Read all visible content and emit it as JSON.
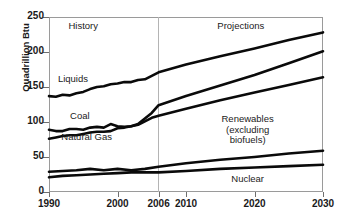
{
  "chart_data": {
    "type": "line",
    "title": "",
    "xlabel": "",
    "ylabel": "Quadrillion Btu",
    "xlim": [
      1990,
      2030
    ],
    "ylim": [
      0,
      250
    ],
    "xticks": [
      1990,
      2000,
      2006,
      2010,
      2020,
      2030
    ],
    "xtick_labels": [
      "1990",
      "2000",
      "2006",
      "2010",
      "2020",
      "2030"
    ],
    "yticks": [
      0,
      50,
      100,
      150,
      200,
      250
    ],
    "ytick_labels": [
      "0",
      "50",
      "100",
      "150",
      "200",
      "250"
    ],
    "grid": false,
    "legend": "inline-annotations",
    "divider_year": 2006,
    "annotations": [
      {
        "name": "history",
        "text": "History",
        "year": 1995,
        "value": 237
      },
      {
        "name": "projections",
        "text": "Projections",
        "year": 2018,
        "value": 237
      },
      {
        "name": "liquids",
        "text": "Liquids",
        "year": 1993.5,
        "value": 162
      },
      {
        "name": "coal",
        "text": "Coal",
        "year": 1994.5,
        "value": 109
      },
      {
        "name": "natural-gas",
        "text": "Natural Gas",
        "year": 1995.5,
        "value": 78
      },
      {
        "name": "renewables",
        "text": "Renewables (excluding biofuels)",
        "year": 2019,
        "value": 88
      },
      {
        "name": "nuclear",
        "text": "Nuclear",
        "year": 2019,
        "value": 18
      }
    ],
    "series": [
      {
        "name": "Liquids",
        "x": [
          1990,
          1991,
          1992,
          1993,
          1994,
          1995,
          1996,
          1997,
          1998,
          1999,
          2000,
          2001,
          2002,
          2003,
          2004,
          2005,
          2006,
          2010,
          2015,
          2020,
          2025,
          2030
        ],
        "values": [
          137,
          136,
          139,
          138,
          141,
          143,
          147,
          150,
          151,
          154,
          155,
          157,
          157,
          160,
          161,
          166,
          171,
          182,
          194,
          205,
          217,
          228
        ]
      },
      {
        "name": "Coal",
        "x": [
          1990,
          1991,
          1992,
          1993,
          1994,
          1995,
          1996,
          1997,
          1998,
          1999,
          2000,
          2001,
          2002,
          2003,
          2004,
          2005,
          2006,
          2010,
          2015,
          2020,
          2025,
          2030
        ],
        "values": [
          89,
          87,
          87,
          90,
          90,
          89,
          92,
          93,
          92,
          97,
          94,
          93,
          94,
          97,
          105,
          113,
          124,
          137,
          152,
          167,
          184,
          201
        ]
      },
      {
        "name": "Natural Gas",
        "x": [
          1990,
          1991,
          1992,
          1993,
          1994,
          1995,
          1996,
          1997,
          1998,
          1999,
          2000,
          2001,
          2002,
          2003,
          2004,
          2005,
          2006,
          2010,
          2015,
          2020,
          2025,
          2030
        ],
        "values": [
          76,
          78,
          80,
          81,
          81,
          83,
          85,
          86,
          86,
          87,
          91,
          92,
          94,
          96,
          101,
          106,
          109,
          119,
          131,
          142,
          153,
          164
        ]
      },
      {
        "name": "Renewables (excluding biofuels)",
        "x": [
          1990,
          1992,
          1994,
          1996,
          1998,
          2000,
          2002,
          2004,
          2006,
          2010,
          2015,
          2020,
          2025,
          2030
        ],
        "values": [
          29,
          30,
          31,
          33,
          31,
          33,
          31,
          33,
          36,
          41,
          46,
          50,
          55,
          59
        ]
      },
      {
        "name": "Nuclear",
        "x": [
          1990,
          1992,
          1994,
          1996,
          1998,
          2000,
          2002,
          2004,
          2006,
          2010,
          2015,
          2020,
          2025,
          2030
        ],
        "values": [
          21,
          23,
          24,
          25,
          26,
          27,
          28,
          28,
          28,
          30,
          33,
          35,
          37,
          39
        ]
      }
    ]
  },
  "axis": {
    "y_title": "Quadrillion Btu"
  }
}
